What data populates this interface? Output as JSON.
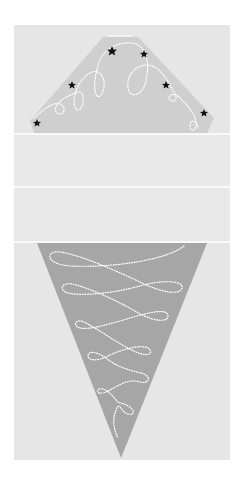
{
  "illustration": {
    "subject": "ice cream cone craft template",
    "colors": {
      "page_background": "#ffffff",
      "panel_background": "#e6e6e6",
      "band_background": "#e9e9e9",
      "divider": "#ffffff",
      "scoop_fill": "#cfcfcf",
      "cone_fill": "#a6a6a6",
      "dotted_line": "#ffffff",
      "star": "#111111"
    },
    "panel": {
      "x": 14,
      "y": 25,
      "width": 216,
      "height": 435
    },
    "dividers_y": [
      134,
      187,
      242
    ],
    "scoop": {
      "points": [
        [
          30,
          121
        ],
        [
          103,
          37
        ],
        [
          138,
          37
        ],
        [
          214,
          118
        ],
        [
          207,
          133
        ],
        [
          34,
          133
        ]
      ],
      "stars": [
        {
          "x": 112,
          "y": 51,
          "size": 5
        },
        {
          "x": 144,
          "y": 54,
          "size": 4
        },
        {
          "x": 72,
          "y": 85,
          "size": 4
        },
        {
          "x": 166,
          "y": 85,
          "size": 4
        },
        {
          "x": 204,
          "y": 113,
          "size": 4
        },
        {
          "x": 37,
          "y": 123,
          "size": 4
        }
      ]
    },
    "cone": {
      "points": [
        [
          37,
          243
        ],
        [
          207,
          243
        ],
        [
          121,
          458
        ]
      ]
    }
  }
}
